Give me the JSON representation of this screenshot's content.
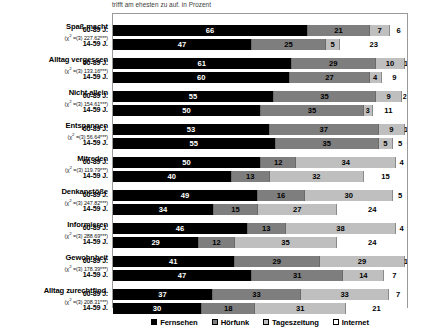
{
  "chart_data": {
    "type": "bar",
    "title": "trifft am ehesten zu auf. in Prozent",
    "orientation": "horizontal",
    "stacked": true,
    "normalized_to": 100,
    "xlabel": "",
    "ylabel": "",
    "xlim": [
      0,
      100
    ],
    "grid": false,
    "legend_position": "bottom",
    "legend": [
      "Fernsehen",
      "Hörfunk",
      "Tageszeitung",
      "Internet"
    ],
    "series_colors": [
      "#000000",
      "#7e7e7e",
      "#bfbfbf",
      "#ffffff"
    ],
    "series": [
      {
        "name": "Fernsehen",
        "values": [
          66,
          47,
          61,
          60,
          55,
          50,
          53,
          55,
          50,
          40,
          49,
          34,
          46,
          29,
          41,
          47,
          37,
          30
        ]
      },
      {
        "name": "Hörfunk",
        "values": [
          21,
          25,
          29,
          27,
          35,
          35,
          37,
          35,
          12,
          13,
          16,
          15,
          13,
          12,
          29,
          31,
          33,
          18
        ]
      },
      {
        "name": "Tageszeitung",
        "values": [
          7,
          5,
          10,
          4,
          9,
          3,
          9,
          5,
          34,
          32,
          30,
          27,
          38,
          35,
          29,
          14,
          33,
          31
        ]
      },
      {
        "name": "Internet",
        "values": [
          6,
          23,
          1,
          9,
          2,
          11,
          1,
          5,
          4,
          15,
          5,
          24,
          4,
          24,
          1,
          7,
          7,
          21
        ]
      }
    ],
    "groups": [
      {
        "category": "Spaß macht",
        "chi_prefix": "(χ² =(3) ",
        "chi_value": "227.62***",
        "chi_suffix": ")",
        "rows": [
          {
            "age": "60-89 J.",
            "values": [
              66,
              21,
              7,
              6
            ]
          },
          {
            "age": "14-59 J.",
            "values": [
              47,
              25,
              5,
              23
            ]
          }
        ]
      },
      {
        "category": "Alltag vergessen",
        "chi_prefix": "(χ² =(3) ",
        "chi_value": "133.16***",
        "chi_suffix": ")",
        "rows": [
          {
            "age": "60-89 J.",
            "values": [
              61,
              29,
              10,
              1
            ]
          },
          {
            "age": "14-59 J.",
            "values": [
              60,
              27,
              4,
              9
            ]
          }
        ]
      },
      {
        "category": "Nicht allein",
        "chi_prefix": "(χ² =(3) ",
        "chi_value": "154.61***",
        "chi_suffix": ")",
        "rows": [
          {
            "age": "60-89 J.",
            "values": [
              55,
              35,
              9,
              2
            ]
          },
          {
            "age": "14-59 J.",
            "values": [
              50,
              35,
              3,
              11
            ]
          }
        ]
      },
      {
        "category": "Entspannen",
        "chi_prefix": "(χ² =(3) ",
        "chi_value": "56.64***",
        "chi_suffix": ")",
        "rows": [
          {
            "age": "60-89 J.",
            "values": [
              53,
              37,
              9,
              1
            ]
          },
          {
            "age": "14-59 J.",
            "values": [
              55,
              35,
              5,
              5
            ]
          }
        ]
      },
      {
        "category": "Mitreden",
        "chi_prefix": "(χ² =(3) ",
        "chi_value": "119.79***",
        "chi_suffix": ")",
        "rows": [
          {
            "age": "60-89 J.",
            "values": [
              50,
              12,
              34,
              4
            ]
          },
          {
            "age": "14-59 J.",
            "values": [
              40,
              13,
              32,
              15
            ]
          }
        ]
      },
      {
        "category": "Denkanstöße",
        "chi_prefix": "(χ² =(3) ",
        "chi_value": "247.82***",
        "chi_suffix": ")",
        "rows": [
          {
            "age": "60-89 J.",
            "values": [
              49,
              16,
              30,
              5
            ]
          },
          {
            "age": "14-59 J.",
            "values": [
              34,
              15,
              27,
              24
            ]
          }
        ]
      },
      {
        "category": "Informieren",
        "chi_prefix": "(χ² =(3) ",
        "chi_value": "288.69***",
        "chi_suffix": ")",
        "rows": [
          {
            "age": "60-89 J.",
            "values": [
              46,
              13,
              38,
              4
            ]
          },
          {
            "age": "14-59 J.",
            "values": [
              29,
              12,
              35,
              24
            ]
          }
        ]
      },
      {
        "category": "Gewohnheit",
        "chi_prefix": "(χ² =(3) ",
        "chi_value": "178.39***",
        "chi_suffix": ")",
        "rows": [
          {
            "age": "60-89 J.",
            "values": [
              41,
              29,
              29,
              1
            ]
          },
          {
            "age": "14-59 J.",
            "values": [
              47,
              31,
              14,
              7
            ]
          }
        ]
      },
      {
        "category": "Alltag zurechtfind.",
        "chi_prefix": "(χ² =(3) ",
        "chi_value": "208.31***",
        "chi_suffix": ")",
        "rows": [
          {
            "age": "60-89 J.",
            "values": [
              37,
              33,
              33,
              7
            ]
          },
          {
            "age": "14-59 J.",
            "values": [
              30,
              18,
              31,
              21
            ]
          }
        ]
      }
    ]
  }
}
